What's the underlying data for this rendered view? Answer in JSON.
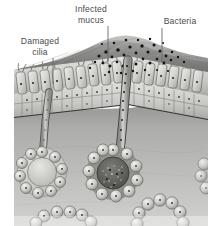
{
  "figure": {
    "background_color": "#ffffff"
  },
  "labels": [
    {
      "id": "damaged-cilia",
      "lines": [
        "Damaged",
        "cilia"
      ],
      "line1": "Damaged",
      "line2": "cilia",
      "text_anchor_x": 40,
      "line1_y": 44,
      "line2_y": 55,
      "leader": {
        "x1": 53,
        "y1": 58,
        "x2": 53,
        "y2": 84
      }
    },
    {
      "id": "infected-mucus",
      "lines": [
        "Infected",
        "mucus"
      ],
      "line1": "Infected",
      "line2": "mucus",
      "text_anchor_x": 91,
      "line1_y": 12,
      "line2_y": 23,
      "leader": {
        "x1": 108,
        "y1": 26,
        "x2": 108,
        "y2": 62
      }
    },
    {
      "id": "bacteria",
      "lines": [
        "Bacteria"
      ],
      "line1": "Bacteria",
      "text_anchor_x": 180,
      "line1_y": 24,
      "leader": {
        "x1": 162,
        "y1": 28,
        "x2": 162,
        "y2": 62
      }
    }
  ],
  "regions": {
    "mucus_layer": {
      "name": "Infected mucus layer",
      "color": "#8a8a8a"
    },
    "epithelium": {
      "name": "Columnar epithelium with damaged cilia",
      "color": "#c9c9c7"
    },
    "basement_membrane": {
      "name": "Basement membrane",
      "color": "#3d3d3d"
    },
    "submucosa": {
      "name": "Submucosa",
      "color": "#a9a9a7"
    },
    "gland_infected": {
      "name": "Infected submucosal gland",
      "color": "#6f6f6d"
    },
    "gland_normal": {
      "name": "Submucosal gland",
      "color": "#bdbdbb"
    },
    "bacteria_dots": {
      "name": "Bacteria",
      "color": "#1a1a1a"
    }
  },
  "colors": {
    "outline": "#3a3a3a",
    "label_text": "#4b4b4b",
    "leader_line": "#6a6a6a",
    "mucus_dark": "#6e6e6e",
    "mucus_light": "#b6b6b4",
    "cell_fill": "#d6d6d3",
    "cell_shadow": "#9a9a97",
    "submucosa_fill": "#b2b2b0",
    "gland_cell": "#c4c4c1",
    "lumen_dark": "#5e5e5c",
    "white": "#ffffff"
  }
}
